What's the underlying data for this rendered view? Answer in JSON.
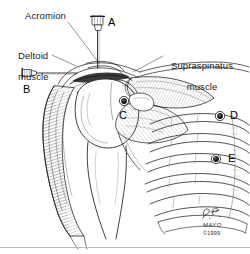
{
  "figure": {
    "background_color": "#ffffff",
    "ink_color": "#1a1a1a",
    "width": 250,
    "height": 254
  },
  "labels": {
    "acromion": "Acromion",
    "deltoid_line1": "Deltoid",
    "deltoid_line2": "muscle",
    "supraspinatus_line1": "Supraspinatus",
    "supraspinatus_line2": "muscle"
  },
  "markers": {
    "a": "A",
    "b": "B",
    "c": "C",
    "d": "D",
    "e": "E"
  },
  "signature": {
    "artist_initials": "P.F.",
    "institution": "MAYO",
    "copyright": "©1999"
  }
}
